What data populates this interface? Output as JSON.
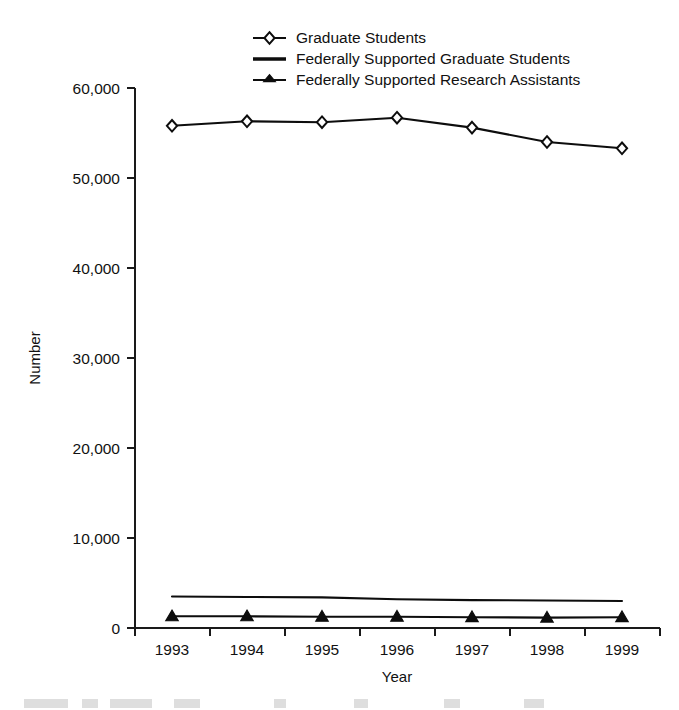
{
  "chart_data": {
    "type": "line",
    "title": "",
    "xlabel": "Year",
    "ylabel": "Number",
    "categories": [
      "1993",
      "1994",
      "1995",
      "1996",
      "1997",
      "1998",
      "1999"
    ],
    "x": [
      1993,
      1994,
      1995,
      1996,
      1997,
      1998,
      1999
    ],
    "ylim": [
      0,
      60000
    ],
    "yticks": [
      0,
      10000,
      20000,
      30000,
      40000,
      50000,
      60000
    ],
    "ytick_labels": [
      "0",
      "10,000",
      "20,000",
      "30,000",
      "40,000",
      "50,000",
      "60,000"
    ],
    "grid": false,
    "legend_position": "top-center",
    "series": [
      {
        "name": "Graduate Students",
        "marker": "diamond-open",
        "values": [
          55800,
          56300,
          56200,
          56700,
          55600,
          54000,
          53300
        ]
      },
      {
        "name": "Federally Supported Graduate Students",
        "marker": "none",
        "values": [
          3500,
          3450,
          3400,
          3200,
          3100,
          3050,
          3000
        ]
      },
      {
        "name": "Federally Supported Research Assistants",
        "marker": "triangle-filled",
        "values": [
          1300,
          1300,
          1250,
          1250,
          1200,
          1150,
          1200
        ]
      }
    ]
  },
  "legend": {
    "entries": [
      {
        "label": "Graduate Students",
        "marker": "diamond-open-icon"
      },
      {
        "label": "Federally Supported Graduate Students",
        "marker": "line-icon"
      },
      {
        "label": "Federally Supported Research Assistants",
        "marker": "triangle-filled-icon"
      }
    ]
  },
  "axes": {
    "y_title": "Number",
    "x_title": "Year",
    "y_labels": [
      "60,000",
      "50,000",
      "40,000",
      "30,000",
      "20,000",
      "10,000",
      "0"
    ],
    "x_labels": [
      "1993",
      "1994",
      "1995",
      "1996",
      "1997",
      "1998",
      "1999"
    ]
  },
  "colors": {
    "ink": "#0d0d0d",
    "background": "#ffffff",
    "marker_fill": "#ffffff"
  }
}
